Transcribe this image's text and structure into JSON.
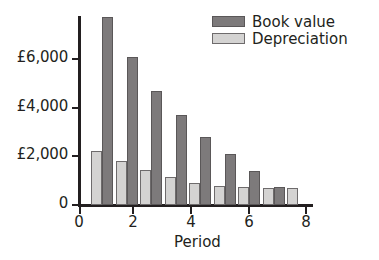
{
  "chart_data": {
    "type": "bar",
    "title": "",
    "subtitle": "",
    "xlabel": "Period",
    "ylabel": "",
    "grid": false,
    "legend_position": "top-right",
    "currency_symbol": "£",
    "x": [
      1,
      2,
      3,
      4,
      5,
      6,
      7,
      8,
      9
    ],
    "categories": [
      "1",
      "2",
      "3",
      "4",
      "5",
      "6",
      "7",
      "8",
      "9"
    ],
    "xlim": [
      0,
      9.6
    ],
    "ylim": [
      0,
      7700
    ],
    "x_tick_labels": [
      "0",
      "2",
      "4",
      "6",
      "8"
    ],
    "x_tick_values": [
      0,
      2,
      4,
      6,
      8
    ],
    "y_tick_labels": [
      "0",
      "£2,000",
      "£4,000",
      "£6,000"
    ],
    "y_tick_values": [
      0,
      2000,
      4000,
      6000
    ],
    "series": [
      {
        "name": "Depreciation",
        "color": "#d4d3d2",
        "values": [
          2200,
          1795,
          1430,
          1140,
          900,
          770,
          730,
          700,
          710
        ]
      },
      {
        "name": "Book value",
        "color": "#7d7a7b",
        "values": [
          7670,
          6040,
          4650,
          3670,
          2780,
          2080,
          1390,
          735,
          null
        ]
      }
    ]
  },
  "legend": {
    "items": [
      {
        "label": "Book value",
        "swatch": "dark-gray-swatch-icon",
        "color": "#7d7a7b"
      },
      {
        "label": "Depreciation",
        "swatch": "light-gray-swatch-icon",
        "color": "#d4d3d2"
      }
    ]
  },
  "axes": {
    "x_title": "Period",
    "x_ticks": [
      "0",
      "2",
      "4",
      "6",
      "8"
    ],
    "y_ticks": [
      "£6,000",
      "£4,000",
      "£2,000",
      "0"
    ]
  }
}
